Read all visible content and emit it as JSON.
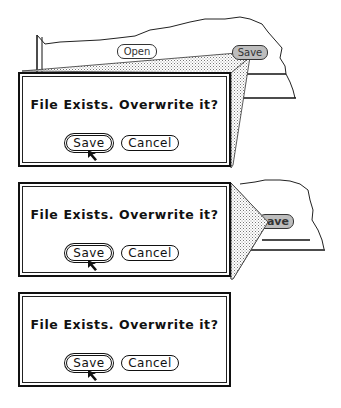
{
  "figure": {
    "panels": [
      {
        "stage": "zoom-start",
        "background_window": {
          "open_label": "Open",
          "save_label": "Save"
        },
        "dialog": {
          "message": "File Exists. Overwrite it?",
          "save_label": "Save",
          "cancel_label": "Cancel"
        }
      },
      {
        "stage": "zoom-middle",
        "background_window": {
          "save_label": "ave"
        },
        "dialog": {
          "message": "File Exists. Overwrite it?",
          "save_label": "Save",
          "cancel_label": "Cancel"
        }
      },
      {
        "stage": "zoom-end",
        "dialog": {
          "message": "File Exists. Overwrite it?",
          "save_label": "Save",
          "cancel_label": "Cancel"
        }
      }
    ]
  },
  "colors": {
    "ink": "#111111",
    "shadow_stipple": "#bdbdbd",
    "highlight_button": "#bdbdbd"
  }
}
